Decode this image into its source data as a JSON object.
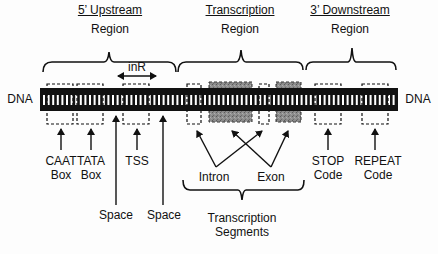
{
  "diagram": {
    "regions": [
      {
        "title": "5’ Upstream",
        "subtitle": "Region"
      },
      {
        "title": "Transcription",
        "subtitle": "Region"
      },
      {
        "title": "3’ Downstream",
        "subtitle": "Region"
      }
    ],
    "dna_left": "DNA",
    "dna_right": "DNA",
    "inr_label": "inR",
    "labels": {
      "caat": [
        "CAAT",
        "Box"
      ],
      "tata": [
        "TATA",
        "Box"
      ],
      "tss": "TSS",
      "space1": "Space",
      "space2": "Space",
      "intron": "Intron",
      "exon": "Exon",
      "segments": [
        "Transcription",
        "Segments"
      ],
      "stop": [
        "STOP",
        "Code"
      ],
      "repeat": [
        "REPEAT",
        "Code"
      ]
    },
    "colors": {
      "dna": "#111111",
      "exon_fill": "#8a8a8a",
      "line": "#111111"
    }
  }
}
